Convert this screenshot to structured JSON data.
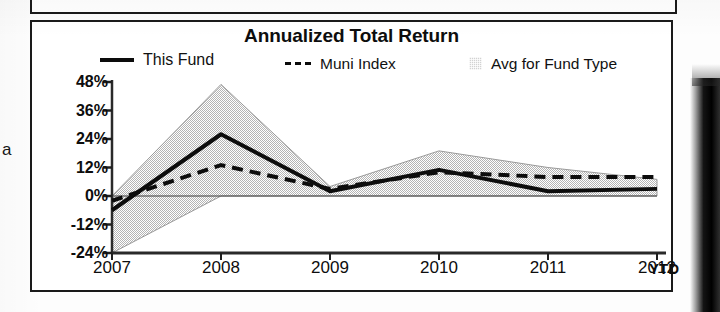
{
  "chart": {
    "title": "Annualized Total Return",
    "ytd_note": "YTD",
    "legend": [
      {
        "label": "This Fund",
        "style": "solid-line",
        "color": "#0c0c0c"
      },
      {
        "label": "Muni Index",
        "style": "dashed-line",
        "color": "#0c0c0c"
      },
      {
        "label": "Avg for Fund Type",
        "style": "shaded-band",
        "color": "#d2d2d2"
      }
    ]
  },
  "stray_text": "a",
  "chart_data": {
    "type": "line",
    "title": "Annualized Total Return",
    "xlabel": "",
    "ylabel": "",
    "x": [
      "2007",
      "2008",
      "2009",
      "2010",
      "2011",
      "2012"
    ],
    "categories": [
      "2007",
      "2008",
      "2009",
      "2010",
      "2011",
      "2012"
    ],
    "xtick_labels": [
      "2007",
      "2008",
      "2009",
      "2010",
      "2011",
      "2012"
    ],
    "ytick_labels": [
      "48%",
      "36%",
      "24%",
      "12%",
      "0%",
      "-12%",
      "-24%"
    ],
    "ytick_values": [
      48,
      36,
      24,
      12,
      0,
      -12,
      -24
    ],
    "ylim": [
      -24,
      48
    ],
    "grid": false,
    "legend_position": "top",
    "series": [
      {
        "name": "This Fund",
        "style": "solid",
        "values": [
          -6,
          26,
          2,
          11,
          2,
          3
        ]
      },
      {
        "name": "Muni Index",
        "style": "dashed",
        "values": [
          -2,
          13,
          3,
          10,
          8,
          8
        ]
      },
      {
        "name": "Avg for Fund Type",
        "style": "band",
        "upper": [
          0,
          47,
          4,
          19,
          12,
          7
        ],
        "lower": [
          -24,
          0,
          0,
          0,
          0,
          0
        ]
      }
    ]
  }
}
